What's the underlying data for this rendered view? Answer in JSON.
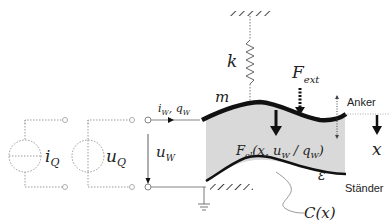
{
  "diagram": {
    "type": "electrostatic transducer schematic",
    "sources": {
      "current_source": {
        "symbol": "i",
        "subscript": "Q"
      },
      "voltage_source": {
        "symbol": "u",
        "subscript": "Q"
      }
    },
    "port": {
      "current_label": {
        "main": "i",
        "sub": "W",
        "sep": ", ",
        "main2": "q",
        "sub2": "W"
      },
      "voltage_label": {
        "main": "u",
        "sub": "W"
      }
    },
    "mechanics": {
      "spring": {
        "symbol": "k"
      },
      "mass": {
        "symbol": "m"
      },
      "external_force": {
        "main": "F",
        "sub": "ext"
      },
      "electric_force": {
        "main": "F",
        "sub": "el",
        "args": "(x, u",
        "args_sub": "W",
        "args2": " / q",
        "args_sub2": "W",
        "args_close": ")"
      },
      "permittivity": {
        "symbol": "ε"
      },
      "capacitance": {
        "text": "C(x)"
      },
      "displacement": {
        "symbol": "x"
      }
    },
    "labels": {
      "anker": "Anker",
      "staender": "Ständer"
    },
    "colors": {
      "gap_fill": "#d9d9d9",
      "line": "#111111",
      "dotted": "#9a9a9a"
    }
  }
}
